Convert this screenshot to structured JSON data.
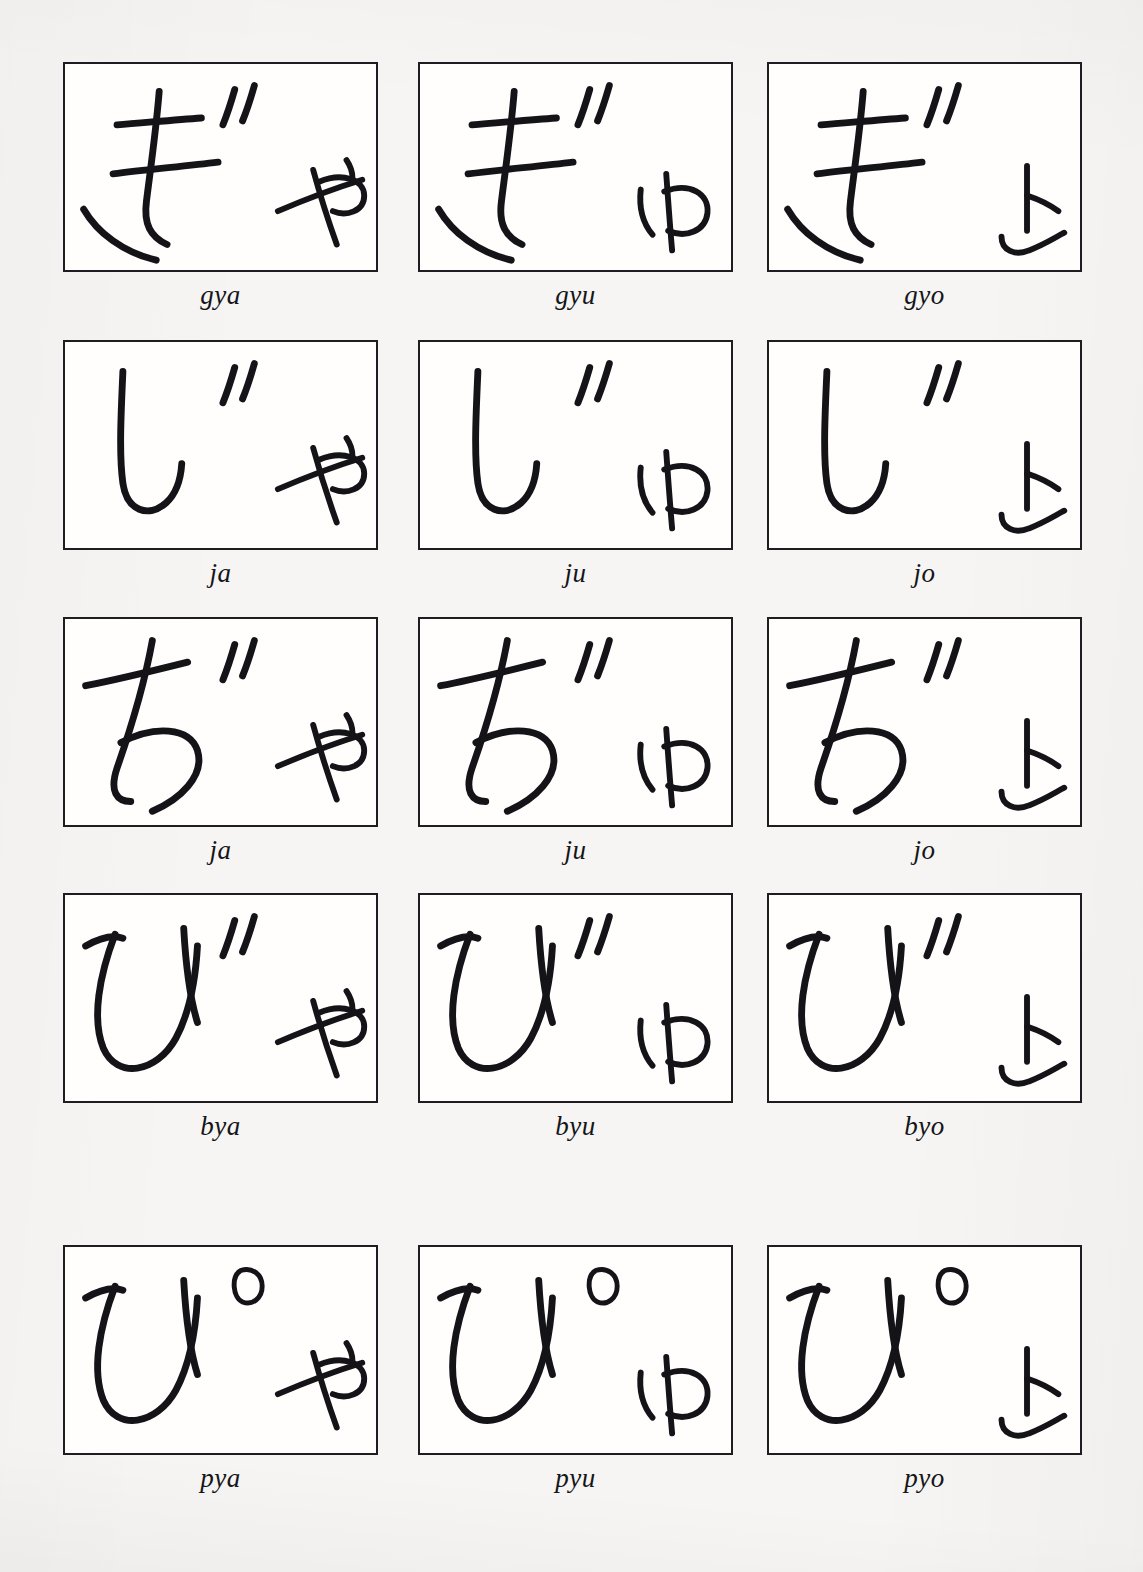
{
  "document": {
    "title": "Hiragana Yoon Handwriting Practice Chart",
    "background_color": "#f6f5f3",
    "ink_color": "#141418",
    "card_background": "#fffefd",
    "card_border_color": "#1e1e22",
    "columns": 3,
    "rows": 5,
    "card_width": 315,
    "card_height": 210
  },
  "grid": {
    "rows": [
      {
        "row_index": 0,
        "top": 62,
        "cells": [
          {
            "label": "gya",
            "kana": "ぎゃ",
            "base": "ぎ",
            "small": "ゃ",
            "diacritic": "dakuten",
            "left": 63
          },
          {
            "label": "gyu",
            "kana": "ぎゅ",
            "base": "ぎ",
            "small": "ゅ",
            "diacritic": "dakuten",
            "left": 418
          },
          {
            "label": "gyo",
            "kana": "ぎょ",
            "base": "ぎ",
            "small": "ょ",
            "diacritic": "dakuten",
            "left": 767
          }
        ]
      },
      {
        "row_index": 1,
        "top": 340,
        "cells": [
          {
            "label": "ja",
            "kana": "じゃ",
            "base": "じ",
            "small": "ゃ",
            "diacritic": "dakuten",
            "left": 63
          },
          {
            "label": "ju",
            "kana": "じゅ",
            "base": "じ",
            "small": "ゅ",
            "diacritic": "dakuten",
            "left": 418
          },
          {
            "label": "jo",
            "kana": "じょ",
            "base": "じ",
            "small": "ょ",
            "diacritic": "dakuten",
            "left": 767
          }
        ]
      },
      {
        "row_index": 2,
        "top": 617,
        "cells": [
          {
            "label": "ja",
            "kana": "ぢゃ",
            "base": "ぢ",
            "small": "ゃ",
            "diacritic": "dakuten",
            "left": 63
          },
          {
            "label": "ju",
            "kana": "ぢゅ",
            "base": "ぢ",
            "small": "ゅ",
            "diacritic": "dakuten",
            "left": 418
          },
          {
            "label": "jo",
            "kana": "ぢょ",
            "base": "ぢ",
            "small": "ょ",
            "diacritic": "dakuten",
            "left": 767
          }
        ]
      },
      {
        "row_index": 3,
        "top": 893,
        "cells": [
          {
            "label": "bya",
            "kana": "びゃ",
            "base": "び",
            "small": "ゃ",
            "diacritic": "dakuten",
            "left": 63
          },
          {
            "label": "byu",
            "kana": "びゅ",
            "base": "び",
            "small": "ゅ",
            "diacritic": "dakuten",
            "left": 418
          },
          {
            "label": "byo",
            "kana": "びょ",
            "base": "び",
            "small": "ょ",
            "diacritic": "dakuten",
            "left": 767
          }
        ]
      },
      {
        "row_index": 4,
        "top": 1245,
        "cells": [
          {
            "label": "pya",
            "kana": "ぴゃ",
            "base": "ぴ",
            "small": "ゃ",
            "diacritic": "handakuten",
            "left": 63
          },
          {
            "label": "pyu",
            "kana": "ぴゅ",
            "base": "ぴ",
            "small": "ゅ",
            "diacritic": "handakuten",
            "left": 418
          },
          {
            "label": "pyo",
            "kana": "ぴょ",
            "base": "ぴ",
            "small": "ょ",
            "diacritic": "handakuten",
            "left": 767
          }
        ]
      }
    ]
  }
}
